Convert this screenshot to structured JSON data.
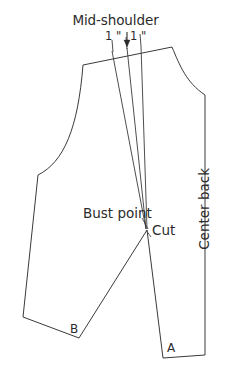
{
  "diagram": {
    "type": "sewing-pattern-slash-and-spread",
    "title": "Mid-shoulder",
    "background_color": "#ffffff",
    "line_color": "#3a3a3a",
    "text_color": "#2b2b2b",
    "labels": {
      "mid_shoulder": "Mid-shoulder",
      "dimension_left": "1 \"",
      "dimension_right": "1 \"",
      "bust_point": "Bust point",
      "cut": "Cut",
      "center_back": "Center back",
      "point_a": "A",
      "point_b": "B"
    },
    "icons": {
      "down_arrow": "down-arrow-icon"
    },
    "geometry": {
      "canvas": {
        "width": 231,
        "height": 375
      },
      "bodice_outline": "M 83,65 L 172,47 C 180,66 186,82 205,95 L 205,355 L 163,358 L 147,230 L 79,338 L 23,317 L 38,175 C 64,162 78,128 83,65 Z",
      "center_back_line": {
        "x": 205,
        "y1": 95,
        "y2": 355
      },
      "shoulder_line": {
        "x1": 83,
        "y1": 65,
        "x2": 172,
        "y2": 47
      },
      "convergence_point": {
        "x": 147,
        "y": 230
      },
      "slash_lines": [
        {
          "x1": 112,
          "y1": 51,
          "x2": 146,
          "y2": 229
        },
        {
          "x1": 127,
          "y1": 48,
          "x2": 146,
          "y2": 229
        },
        {
          "x1": 141,
          "y1": 46,
          "x2": 147,
          "y2": 229
        }
      ],
      "tick_marks": [
        {
          "x1": 113,
          "y1": 52,
          "x2": 112,
          "y2": 40
        },
        {
          "x1": 127,
          "y1": 49,
          "x2": 126,
          "y2": 37
        },
        {
          "x1": 141,
          "y1": 46,
          "x2": 140,
          "y2": 34
        }
      ],
      "bust_pointer": {
        "x1": 143,
        "y1": 219,
        "x2": 148,
        "y2": 229
      },
      "cut_pointer": {
        "x1": 150,
        "y1": 236,
        "x2": 146,
        "y2": 230
      },
      "down_arrow": {
        "x": 127,
        "y_top": 32,
        "y_bottom": 46
      },
      "point_a": {
        "x": 163,
        "y": 358
      },
      "point_b": {
        "x": 79,
        "y": 338
      }
    }
  }
}
